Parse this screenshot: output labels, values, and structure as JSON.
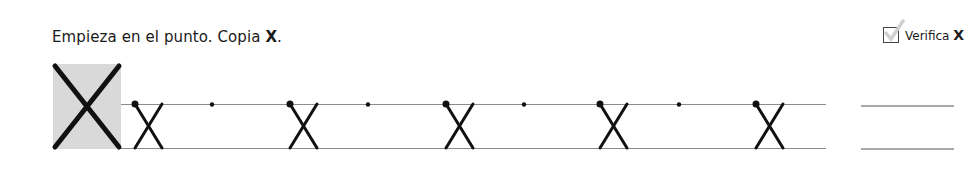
{
  "instruction": {
    "text": "Empieza en el punto. Copia ",
    "letter": "X",
    "suffix": "."
  },
  "verify": {
    "label": "Verifica",
    "letter": "X",
    "icon": "checkbox-check-icon"
  },
  "model_letter": {
    "letter": "X",
    "background": "#d9d9d9"
  },
  "practice_row": {
    "traced_letters_x": [
      148,
      304,
      459,
      614,
      769
    ],
    "start_dots_x": [
      213,
      368,
      524,
      679
    ],
    "line_color": "#8c8c8c",
    "ink_color": "#111111"
  },
  "answer_lines": 2
}
